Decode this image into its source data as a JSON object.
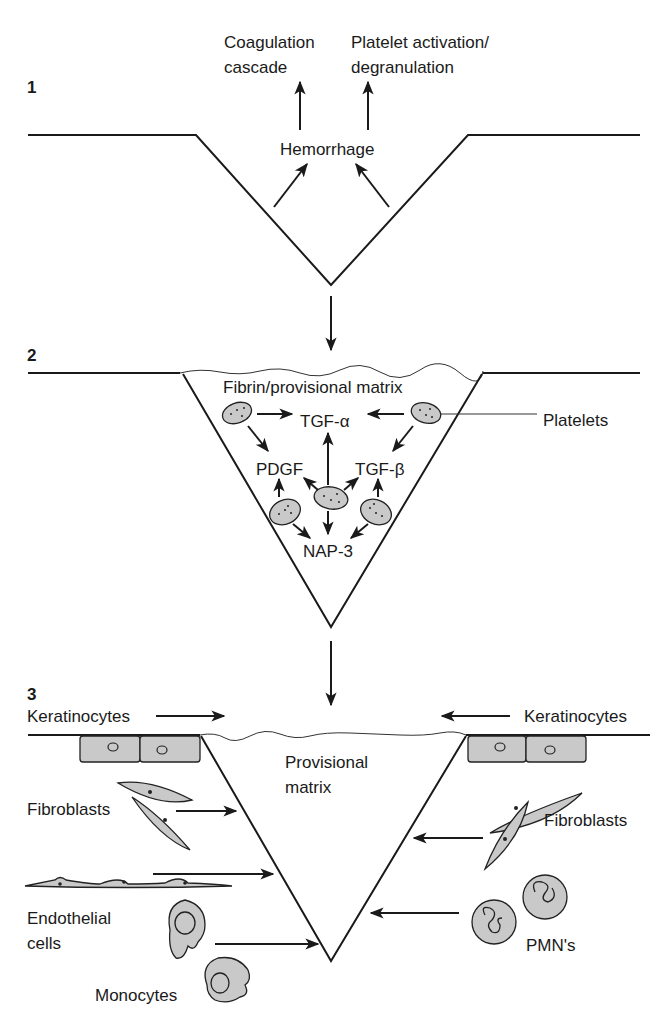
{
  "diagram": {
    "colors": {
      "line": "#1a1a1a",
      "cell_fill": "#c9c9c9",
      "background": "#ffffff"
    },
    "stage1": {
      "number": "1",
      "labels": {
        "coag_line1": "Coagulation",
        "coag_line2": "cascade",
        "plt_line1": "Platelet activation/",
        "plt_line2": "degranulation",
        "center": "Hemorrhage"
      }
    },
    "stage2": {
      "number": "2",
      "labels": {
        "matrix": "Fibrin/provisional matrix",
        "tgfa": "TGF-α",
        "pdgf": "PDGF",
        "tgfb": "TGF-β",
        "nap3": "NAP-3",
        "platelets": "Platelets"
      }
    },
    "stage3": {
      "number": "3",
      "labels": {
        "kera_left": "Keratinocytes",
        "kera_right": "Keratinocytes",
        "matrix_line1": "Provisional",
        "matrix_line2": "matrix",
        "fibro_left": "Fibroblasts",
        "fibro_right": "Fibroblasts",
        "endo_line1": "Endothelial",
        "endo_line2": "cells",
        "monocytes": "Monocytes",
        "pmns": "PMN's"
      }
    }
  }
}
